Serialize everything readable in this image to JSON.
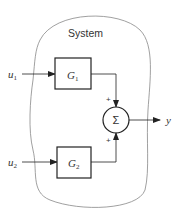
{
  "diagram": {
    "title": "System",
    "inputs": [
      {
        "name": "u",
        "subscript": "1"
      },
      {
        "name": "u",
        "subscript": "2"
      }
    ],
    "blocks": [
      {
        "name": "G",
        "subscript": "1"
      },
      {
        "name": "G",
        "subscript": "2"
      }
    ],
    "summer": {
      "symbol": "Σ",
      "signs": [
        "+",
        "+"
      ]
    },
    "output": {
      "name": "y"
    },
    "colors": {
      "stroke": "#222222",
      "boundary": "#888888",
      "text": "#333333"
    }
  }
}
